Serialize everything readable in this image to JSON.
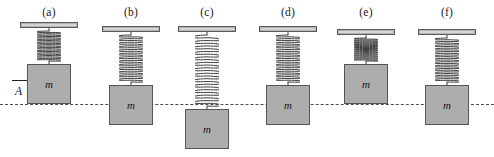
{
  "figure": {
    "caption_labels": [
      "(a)",
      "(b)",
      "(c)",
      "(d)",
      "(e)",
      "(f)"
    ],
    "mass_label": "m",
    "amplitude_label": "A",
    "colors": {
      "block_fill": "#adadad",
      "block_stroke": "#555555",
      "ceiling_fill": "#b3b3b3",
      "ceiling_stroke": "#5a5a5a",
      "spring_stroke": "#3d3d3d",
      "equilibrium_line": "#4d4d4d",
      "text": "#1a1a1a",
      "background": "#ffffff"
    },
    "equilibrium_line_y": 104
  },
  "chart_data": {
    "type": "diagram",
    "equilibrium_line_label": "equilibrium position",
    "amplitude_annotation": {
      "label": "A",
      "meaning": "amplitude",
      "measured_in_panel": "(a)",
      "from_y": 80,
      "to_y": 104
    },
    "panels": [
      {
        "label": "(a)",
        "mass_label": "m",
        "phase": "top of motion",
        "displacement": "+A",
        "spring_state": "most compressed",
        "spring_coils": 11,
        "block_center_offset_px": -24,
        "block_top_y": 64,
        "block_bottom_y": 104,
        "ceiling_y": 22,
        "panel_center_x": 49
      },
      {
        "label": "(b)",
        "mass_label": "m",
        "phase": "equilibrium moving downward",
        "displacement": "0",
        "spring_state": "natural, moderately stretched",
        "spring_coils": 13,
        "block_center_offset_px": 0,
        "block_top_y": 85,
        "block_bottom_y": 125,
        "ceiling_y": 26,
        "panel_center_x": 131
      },
      {
        "label": "(c)",
        "mass_label": "m",
        "phase": "bottom of motion",
        "displacement": "-A",
        "spring_state": "most stretched",
        "spring_coils": 13,
        "block_center_offset_px": 24,
        "block_top_y": 109,
        "block_bottom_y": 149,
        "ceiling_y": 26,
        "panel_center_x": 207
      },
      {
        "label": "(d)",
        "mass_label": "m",
        "phase": "equilibrium moving upward",
        "displacement": "0",
        "spring_state": "natural, moderately stretched",
        "spring_coils": 13,
        "block_center_offset_px": 0,
        "block_top_y": 85,
        "block_bottom_y": 125,
        "ceiling_y": 26,
        "panel_center_x": 288
      },
      {
        "label": "(e)",
        "mass_label": "m",
        "phase": "top of motion",
        "displacement": "+A",
        "spring_state": "most compressed",
        "spring_coils": 11,
        "block_center_offset_px": -24,
        "block_top_y": 64,
        "block_bottom_y": 104,
        "ceiling_y": 29,
        "panel_center_x": 366
      },
      {
        "label": "(f)",
        "mass_label": "m",
        "phase": "equilibrium moving downward",
        "displacement": "0",
        "spring_state": "natural, moderately stretched",
        "spring_coils": 13,
        "block_center_offset_px": 0,
        "block_top_y": 85,
        "block_bottom_y": 125,
        "ceiling_y": 29,
        "panel_center_x": 447
      }
    ]
  }
}
